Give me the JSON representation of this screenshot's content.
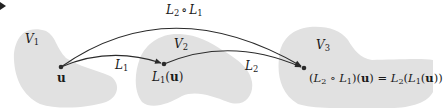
{
  "colors": {
    "background": "#ffffff",
    "blob_fill": "#e1e1e1",
    "stroke": "#2b2b2b",
    "text": "#1a1a1a"
  },
  "spaces": [
    {
      "id": "V1",
      "symbol": "V",
      "sub": "1"
    },
    {
      "id": "V2",
      "symbol": "V",
      "sub": "2"
    },
    {
      "id": "V3",
      "symbol": "V",
      "sub": "3"
    }
  ],
  "maps": {
    "l1": {
      "symbol": "L",
      "sub": "1"
    },
    "l2": {
      "symbol": "L",
      "sub": "2"
    },
    "composite": {
      "left": "L",
      "left_sub": "2",
      "op": "∘",
      "right": "L",
      "right_sub": "1"
    }
  },
  "points": {
    "u": {
      "label": "u"
    },
    "l1u": {
      "prefix": "L",
      "sub": "1",
      "open": "(",
      "arg": "u",
      "close": ")"
    },
    "result": {
      "p1": "(",
      "a": "L",
      "a_sub": "2",
      "op": " ∘ ",
      "b": "L",
      "b_sub": "1",
      "p2": ")(",
      "arg": "u",
      "p3": ") = ",
      "c": "L",
      "c_sub": "2",
      "p4": "(",
      "d": "L",
      "d_sub": "1",
      "p5": "(",
      "arg2": "u",
      "p6": "))"
    }
  },
  "corner_marker": {
    "icon": "arrow-right-icon",
    "glyph": "►"
  }
}
